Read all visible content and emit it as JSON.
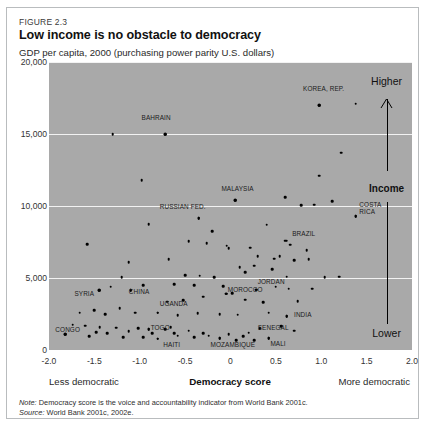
{
  "figure": {
    "number": "FIGURE 2.3",
    "title": "Low income is no obstacle to democracy",
    "y_axis_caption": "GDP per capita, 2000 (purchasing power parity U.S. dollars)",
    "note_label": "Note:",
    "note_text": "Democracy score is the voice and accountability indicator from World Bank 2001c.",
    "source_label": "Source:",
    "source_text": "World Bank 2001c, 2002e."
  },
  "annotations": {
    "higher": "Higher",
    "income": "Income",
    "lower": "Lower",
    "less_democratic": "Less democratic",
    "more_democratic": "More democratic"
  },
  "colors": {
    "plot_background": "#a9a9a9",
    "gridline": "#f2f2f2",
    "point": "#000000",
    "frame": "#b9bcbe",
    "text": "#231f20"
  },
  "chart_data": {
    "type": "scatter",
    "title": "Low income is no obstacle to democracy",
    "xlabel": "Democracy score",
    "ylabel": "GDP per capita, 2000 (purchasing power parity U.S. dollars)",
    "xlim": [
      -2.0,
      2.0
    ],
    "ylim": [
      0,
      20000
    ],
    "xticks": [
      "-2.0",
      "-1.5",
      "-1.0",
      "-0.5",
      "0",
      "0.5",
      "1.0",
      "1.5",
      "2.0"
    ],
    "xtick_values": [
      -2.0,
      -1.5,
      -1.0,
      -0.5,
      0,
      0.5,
      1.0,
      1.5,
      2.0
    ],
    "yticks": [
      "0",
      "5,000",
      "10,000",
      "15,000",
      "20,000"
    ],
    "ytick_values": [
      0,
      5000,
      10000,
      15000,
      20000
    ],
    "grid": "horizontal",
    "legend": "none",
    "labeled_points": [
      {
        "name": "KOREA, REP.",
        "x": 0.98,
        "y": 17000,
        "lx": 0.8,
        "ly": 18100
      },
      {
        "name": "BAHRAIN",
        "x": -0.72,
        "y": 15000,
        "lx": -0.98,
        "ly": 16100
      },
      {
        "name": "MALAYSIA",
        "x": 0.05,
        "y": 10400,
        "lx": -0.1,
        "ly": 11150
      },
      {
        "name": "RUSSIAN FED.",
        "x": -0.35,
        "y": 9150,
        "lx": -0.78,
        "ly": 9900
      },
      {
        "name": "BRAZIL",
        "x": 0.62,
        "y": 7600,
        "lx": 0.68,
        "ly": 8050
      },
      {
        "name": "COSTA RICA",
        "x": 1.38,
        "y": 9300,
        "lx": 1.42,
        "ly": 10100
      },
      {
        "name": "JORDAN",
        "x": 0.28,
        "y": 4200,
        "lx": 0.3,
        "ly": 4700
      },
      {
        "name": "MOROCCO",
        "x": -0.05,
        "y": 3900,
        "lx": -0.03,
        "ly": 4200
      },
      {
        "name": "CHINA",
        "x": -1.1,
        "y": 4150,
        "lx": -1.12,
        "ly": 4050
      },
      {
        "name": "SYRIA",
        "x": -1.45,
        "y": 4150,
        "lx": -1.72,
        "ly": 3900
      },
      {
        "name": "UGANDA",
        "x": -0.8,
        "y": 2600,
        "lx": -0.78,
        "ly": 3200
      },
      {
        "name": "CONGO",
        "x": -1.82,
        "y": 1100,
        "lx": -1.93,
        "ly": 1400
      },
      {
        "name": "TOGO",
        "x": -0.9,
        "y": 1450,
        "lx": -0.88,
        "ly": 1500
      },
      {
        "name": "HAITI",
        "x": -0.8,
        "y": 780,
        "lx": -0.74,
        "ly": 380
      },
      {
        "name": "MOZAMBIQUE",
        "x": -0.12,
        "y": 800,
        "lx": -0.22,
        "ly": 320
      },
      {
        "name": "SENEGAL",
        "x": 0.32,
        "y": 1500,
        "lx": 0.3,
        "ly": 1550
      },
      {
        "name": "MALI",
        "x": 0.42,
        "y": 800,
        "lx": 0.44,
        "ly": 420
      },
      {
        "name": "INDIA",
        "x": 0.62,
        "y": 2350,
        "lx": 0.7,
        "ly": 2400
      }
    ],
    "points": [
      {
        "x": -1.3,
        "y": 15000
      },
      {
        "x": -0.72,
        "y": 15000
      },
      {
        "x": 0.98,
        "y": 17000
      },
      {
        "x": 1.38,
        "y": 17100
      },
      {
        "x": 1.22,
        "y": 13700
      },
      {
        "x": -0.98,
        "y": 11800
      },
      {
        "x": 0.98,
        "y": 12100
      },
      {
        "x": 0.6,
        "y": 10600
      },
      {
        "x": 0.05,
        "y": 10400
      },
      {
        "x": 1.12,
        "y": 10350
      },
      {
        "x": 0.78,
        "y": 10050
      },
      {
        "x": 0.92,
        "y": 10100
      },
      {
        "x": 1.38,
        "y": 9300
      },
      {
        "x": -0.35,
        "y": 9150
      },
      {
        "x": -0.9,
        "y": 8750
      },
      {
        "x": 0.4,
        "y": 8700
      },
      {
        "x": 0.6,
        "y": 7600
      },
      {
        "x": 0.66,
        "y": 7300
      },
      {
        "x": -0.2,
        "y": 8250
      },
      {
        "x": -0.46,
        "y": 7550
      },
      {
        "x": -0.26,
        "y": 7400
      },
      {
        "x": -0.04,
        "y": 7250
      },
      {
        "x": -0.02,
        "y": 7050
      },
      {
        "x": 0.22,
        "y": 7100
      },
      {
        "x": -1.58,
        "y": 7350
      },
      {
        "x": -0.68,
        "y": 6300
      },
      {
        "x": 0.84,
        "y": 6950
      },
      {
        "x": 0.3,
        "y": 6500
      },
      {
        "x": 0.48,
        "y": 6350
      },
      {
        "x": 0.54,
        "y": 6500
      },
      {
        "x": 0.7,
        "y": 6250
      },
      {
        "x": 0.86,
        "y": 6300
      },
      {
        "x": -1.12,
        "y": 6100
      },
      {
        "x": 0.1,
        "y": 5750
      },
      {
        "x": 0.26,
        "y": 5850
      },
      {
        "x": 0.46,
        "y": 5600
      },
      {
        "x": 0.16,
        "y": 5400
      },
      {
        "x": -1.2,
        "y": 5050
      },
      {
        "x": -0.5,
        "y": 5200
      },
      {
        "x": -0.34,
        "y": 5150
      },
      {
        "x": -0.18,
        "y": 5050
      },
      {
        "x": 0.62,
        "y": 5100
      },
      {
        "x": 1.04,
        "y": 5050
      },
      {
        "x": 1.2,
        "y": 5100
      },
      {
        "x": -1.45,
        "y": 4150
      },
      {
        "x": -1.1,
        "y": 4150
      },
      {
        "x": -1.32,
        "y": 4400
      },
      {
        "x": -0.96,
        "y": 4500
      },
      {
        "x": -0.62,
        "y": 4550
      },
      {
        "x": -0.4,
        "y": 4500
      },
      {
        "x": -0.08,
        "y": 4450
      },
      {
        "x": 0.28,
        "y": 4200
      },
      {
        "x": 0.5,
        "y": 4400
      },
      {
        "x": 0.64,
        "y": 4250
      },
      {
        "x": 0.9,
        "y": 4250
      },
      {
        "x": -0.05,
        "y": 3900
      },
      {
        "x": 0.02,
        "y": 3950
      },
      {
        "x": -0.3,
        "y": 3700
      },
      {
        "x": -0.7,
        "y": 3350
      },
      {
        "x": -0.52,
        "y": 3450
      },
      {
        "x": 0.16,
        "y": 3500
      },
      {
        "x": 0.36,
        "y": 3300
      },
      {
        "x": 0.74,
        "y": 3400
      },
      {
        "x": -1.66,
        "y": 2600
      },
      {
        "x": -1.5,
        "y": 2750
      },
      {
        "x": -1.38,
        "y": 2500
      },
      {
        "x": -1.22,
        "y": 2900
      },
      {
        "x": -1.05,
        "y": 2600
      },
      {
        "x": -0.8,
        "y": 2600
      },
      {
        "x": -0.58,
        "y": 2400
      },
      {
        "x": -0.36,
        "y": 2550
      },
      {
        "x": -0.12,
        "y": 2500
      },
      {
        "x": 0.08,
        "y": 2450
      },
      {
        "x": 0.42,
        "y": 2600
      },
      {
        "x": 0.62,
        "y": 2350
      },
      {
        "x": -1.74,
        "y": 1750
      },
      {
        "x": -1.6,
        "y": 1700
      },
      {
        "x": -1.44,
        "y": 1600
      },
      {
        "x": -1.26,
        "y": 1550
      },
      {
        "x": -1.48,
        "y": 1250
      },
      {
        "x": -1.36,
        "y": 1150
      },
      {
        "x": -1.82,
        "y": 1100
      },
      {
        "x": -1.18,
        "y": 900
      },
      {
        "x": -1.02,
        "y": 1500
      },
      {
        "x": -0.9,
        "y": 1450
      },
      {
        "x": -0.86,
        "y": 1150
      },
      {
        "x": -0.8,
        "y": 780
      },
      {
        "x": -0.72,
        "y": 1450
      },
      {
        "x": -0.66,
        "y": 1600
      },
      {
        "x": -0.62,
        "y": 1150
      },
      {
        "x": -0.58,
        "y": 1000
      },
      {
        "x": -0.46,
        "y": 1350
      },
      {
        "x": -0.4,
        "y": 900
      },
      {
        "x": -0.3,
        "y": 1150
      },
      {
        "x": -0.24,
        "y": 1000
      },
      {
        "x": -0.12,
        "y": 800
      },
      {
        "x": -0.02,
        "y": 1100
      },
      {
        "x": 0.06,
        "y": 700
      },
      {
        "x": 0.14,
        "y": 950
      },
      {
        "x": 0.2,
        "y": 1200
      },
      {
        "x": 0.32,
        "y": 1500
      },
      {
        "x": 0.42,
        "y": 800
      },
      {
        "x": 0.56,
        "y": 1650
      },
      {
        "x": -1.56,
        "y": 950
      },
      {
        "x": -1.12,
        "y": 1300
      },
      {
        "x": -0.96,
        "y": 900
      },
      {
        "x": 0.26,
        "y": 700
      },
      {
        "x": 0.7,
        "y": 1350
      }
    ]
  }
}
